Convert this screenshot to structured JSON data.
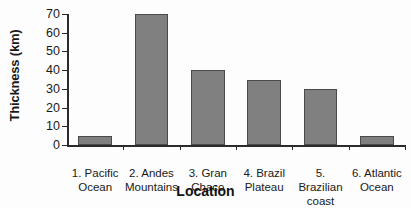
{
  "chart_data": {
    "type": "bar",
    "title": "",
    "xlabel": "Location",
    "ylabel": "Thickness (km)",
    "categories": [
      "1. Pacific Ocean",
      "2. Andes Mountains",
      "3. Gran Chaco",
      "4. Brazil Plateau",
      "5. Brazilian coast",
      "6. Atlantic Ocean"
    ],
    "category_lines": [
      [
        "1. Pacific",
        "Ocean"
      ],
      [
        "2. Andes",
        "Mountains"
      ],
      [
        "3. Gran",
        "Chaco"
      ],
      [
        "4. Brazil",
        "Plateau"
      ],
      [
        "5. Brazilian",
        "coast"
      ],
      [
        "6. Atlantic",
        "Ocean"
      ]
    ],
    "values": [
      5,
      70,
      40,
      35,
      30,
      5
    ],
    "ylim": [
      0,
      70
    ],
    "yticks": [
      0,
      10,
      20,
      30,
      40,
      50,
      60,
      70
    ],
    "ytick_labels": [
      "0",
      "10",
      "20",
      "30",
      "40",
      "50",
      "60",
      "70"
    ],
    "grid": false,
    "legend": null,
    "bar_color": "#808080",
    "bar_border_color": "#4a4a4a",
    "axis_color": "#2b2b2b",
    "background_color": "#fdfdfd"
  }
}
